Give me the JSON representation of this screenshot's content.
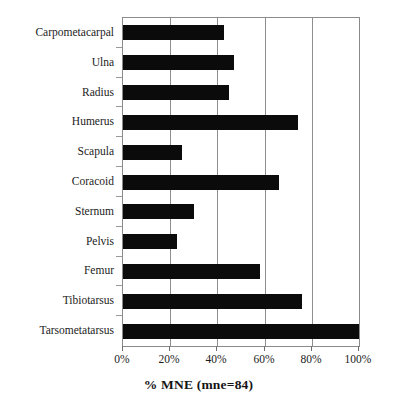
{
  "chart_data": {
    "type": "bar",
    "orientation": "horizontal",
    "title": "",
    "xlabel": "% MNE (mne=84)",
    "ylabel": "Element",
    "xlim": [
      0,
      100
    ],
    "xticks": [
      0,
      20,
      40,
      60,
      80,
      100
    ],
    "xtick_labels": [
      "0%",
      "20%",
      "40%",
      "60%",
      "80%",
      "100%"
    ],
    "grid": "vertical",
    "legend": "none",
    "bar_color": "#0b0b0b",
    "categories": [
      "Carpometacarpal",
      "Ulna",
      "Radius",
      "Humerus",
      "Scapula",
      "Coracoid",
      "Sternum",
      "Pelvis",
      "Femur",
      "Tibiotarsus",
      "Tarsometatarsus"
    ],
    "values": [
      43,
      47,
      45,
      74,
      25,
      66,
      30,
      23,
      58,
      76,
      100
    ]
  }
}
